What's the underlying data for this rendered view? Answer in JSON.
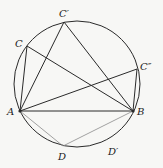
{
  "diagram": {
    "circle": {
      "cx": 77,
      "cy": 84,
      "r": 63,
      "color": "#2a2a2a"
    },
    "points": {
      "A": {
        "x": 20,
        "y": 111,
        "label": "A",
        "lx": 7,
        "ly": 115
      },
      "B": {
        "x": 133,
        "y": 111,
        "label": "B",
        "lx": 137,
        "ly": 115
      },
      "C": {
        "x": 27,
        "y": 46,
        "label": "C",
        "lx": 15,
        "ly": 47
      },
      "C1": {
        "x": 64,
        "y": 22,
        "label": "C′",
        "lx": 59,
        "ly": 17
      },
      "C2": {
        "x": 137,
        "y": 69,
        "label": "C″",
        "lx": 140,
        "ly": 70
      },
      "D": {
        "x": 63,
        "y": 146,
        "label": "D",
        "lx": 58,
        "ly": 160
      },
      "D1": {
        "label": "D′",
        "lx": 108,
        "ly": 155
      }
    },
    "segments": [
      {
        "from": "A",
        "to": "B",
        "style": "dark"
      },
      {
        "from": "A",
        "to": "C",
        "style": "dark"
      },
      {
        "from": "C",
        "to": "B",
        "style": "dark"
      },
      {
        "from": "A",
        "to": "C1",
        "style": "dark"
      },
      {
        "from": "C1",
        "to": "B",
        "style": "dark"
      },
      {
        "from": "A",
        "to": "C2",
        "style": "dark"
      },
      {
        "from": "C2",
        "to": "B",
        "style": "dark"
      },
      {
        "from": "A",
        "to": "D",
        "style": "light"
      },
      {
        "from": "D",
        "to": "B",
        "style": "light"
      }
    ],
    "colors": {
      "dark": "#2a2a2a",
      "light": "#8a8a8a"
    }
  }
}
